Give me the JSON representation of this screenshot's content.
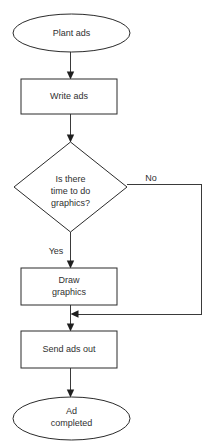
{
  "diagram": {
    "background_color": "#ffffff",
    "stroke_color": "#2b2b2b",
    "line_color": "#3a3a3a",
    "text_color": "#303030",
    "nodes": [
      {
        "id": "start",
        "shape": "ellipse",
        "name": "start-node-plant-ads",
        "lines": [
          "Plant ads"
        ],
        "line1": "Plant ads",
        "cx": 71.5,
        "cy": 33,
        "rx": 58.5,
        "ry": 19
      },
      {
        "id": "write-ads",
        "shape": "rectangle",
        "name": "process-node-write-ads",
        "lines": [
          "Write ads"
        ],
        "line1": "Write ads",
        "x": 21,
        "y": 79,
        "width": 96,
        "height": 35
      },
      {
        "id": "decision",
        "shape": "diamond",
        "name": "decision-node-time-for-graphics",
        "lines": [
          "Is there",
          "time to do",
          "graphics?"
        ],
        "line1": "Is there",
        "line2": "time to do",
        "line3": "graphics?",
        "cx": 70.5,
        "cy": 187,
        "rx": 56.5,
        "ry": 45
      },
      {
        "id": "draw-graphics",
        "shape": "rectangle",
        "name": "process-node-draw-graphics",
        "lines": [
          "Draw",
          "graphics"
        ],
        "line1": "Draw",
        "line2": "graphics",
        "x": 21,
        "y": 268,
        "width": 96,
        "height": 37
      },
      {
        "id": "send-ads-out",
        "shape": "rectangle",
        "name": "process-node-send-ads-out",
        "lines": [
          "Send ads out"
        ],
        "line1": "Send ads out",
        "x": 21,
        "y": 331,
        "width": 96,
        "height": 37
      },
      {
        "id": "end",
        "shape": "ellipse",
        "name": "end-node-ad-completed",
        "lines": [
          "Ad",
          "completed"
        ],
        "line1": "Ad",
        "line2": "completed",
        "cx": 71.5,
        "cy": 418.5,
        "rx": 58.5,
        "ry": 21.5
      }
    ],
    "edges": [
      {
        "id": "edge-start-to-write",
        "name": "edge-start-to-write-ads",
        "from": "start",
        "to": "write-ads",
        "label": ""
      },
      {
        "id": "edge-write-to-decision",
        "name": "edge-write-ads-to-decision",
        "from": "write-ads",
        "to": "decision",
        "label": ""
      },
      {
        "id": "edge-decision-yes",
        "name": "edge-decision-yes-to-draw-graphics",
        "from": "decision",
        "to": "draw-graphics",
        "label": "Yes",
        "label_x": 56,
        "label_y": 252
      },
      {
        "id": "edge-decision-no",
        "name": "edge-decision-no-bypass",
        "from": "decision",
        "to": "merge-point",
        "label": "No",
        "label_x": 151,
        "label_y": 179
      },
      {
        "id": "edge-draw-to-send",
        "name": "edge-draw-graphics-to-send-ads-out",
        "from": "draw-graphics",
        "to": "send-ads-out",
        "label": ""
      },
      {
        "id": "edge-send-to-end",
        "name": "edge-send-ads-out-to-end",
        "from": "send-ads-out",
        "to": "end",
        "label": ""
      }
    ]
  }
}
